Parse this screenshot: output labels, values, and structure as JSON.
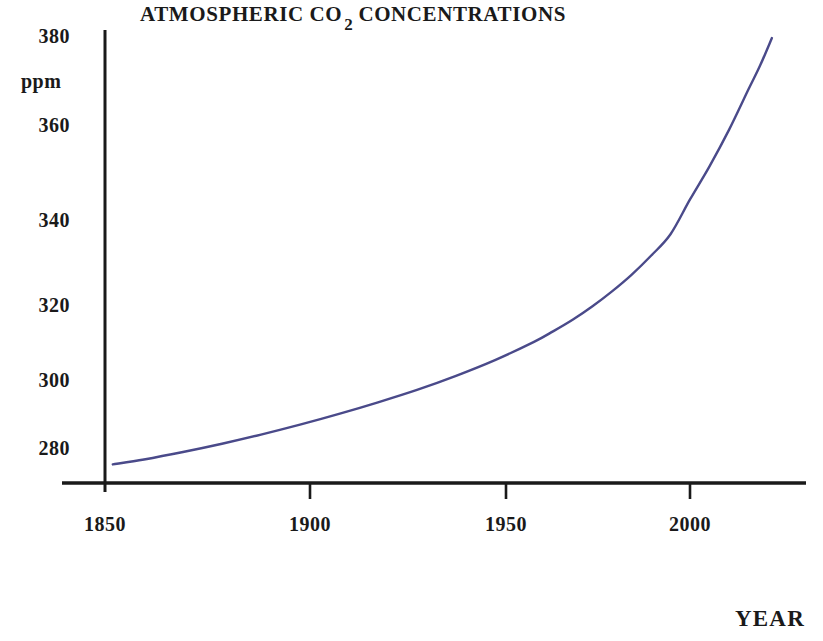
{
  "chart_data": {
    "type": "line",
    "title_main": "ATMOSPHERIC CO",
    "title_sub": "2",
    "title_tail": "CONCENTRATIONS",
    "xlabel": "YEAR",
    "ylabel": "ppm",
    "xlim": [
      1838,
      2030
    ],
    "ylim": [
      272,
      385
    ],
    "grid": false,
    "legend": "none",
    "line_color": "#4a4a8a",
    "axis_color": "#1a1a1a",
    "x_ticks": [
      1850,
      1900,
      1950,
      2000
    ],
    "x_tick_labels": [
      "1850",
      "1900",
      "1950",
      "2000"
    ],
    "y_ticks": [
      280,
      300,
      320,
      340,
      360,
      380
    ],
    "y_tick_labels": [
      "280",
      "300",
      "320",
      "340",
      "360",
      "380"
    ],
    "x": [
      1852,
      1860,
      1870,
      1880,
      1890,
      1900,
      1910,
      1920,
      1930,
      1940,
      1950,
      1960,
      1965,
      1970,
      1975,
      1980,
      1985,
      1990,
      1995,
      2000,
      2005,
      2010,
      2015,
      2018,
      2021
    ],
    "values": [
      277.0,
      278.2,
      280.0,
      282.0,
      284.2,
      286.6,
      289.2,
      292.0,
      295.0,
      298.4,
      302.2,
      306.6,
      309.2,
      312.0,
      315.2,
      318.8,
      322.8,
      327.4,
      332.6,
      341.0,
      349.0,
      357.8,
      367.6,
      373.4,
      380.0
    ]
  }
}
